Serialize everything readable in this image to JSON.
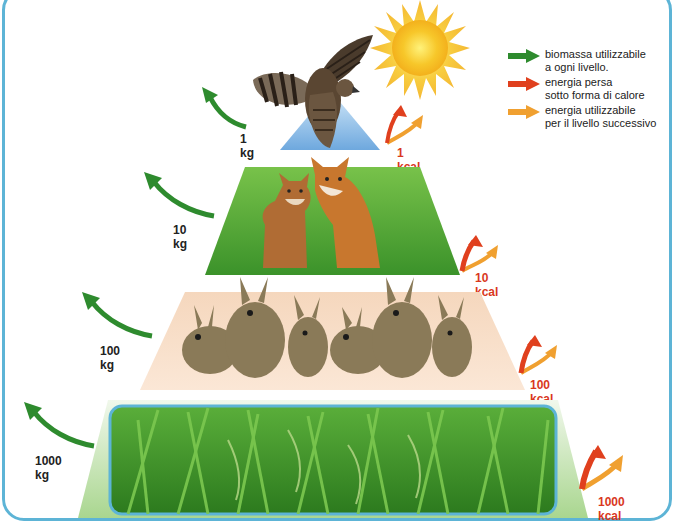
{
  "legend": {
    "items": [
      {
        "color": "#2e8b2e",
        "line1": "biomassa utilizzabile",
        "line2": "a ogni livello."
      },
      {
        "color": "#e0401e",
        "line1": "energia persa",
        "line2": "sotto forma di calore"
      },
      {
        "color": "#f0a030",
        "line1": "energia utilizzabile",
        "line2": "per il livello successivo"
      }
    ]
  },
  "levels": [
    {
      "name": "falco",
      "biomass": "1 kg",
      "energy": "1 kcal",
      "bg_color": "#7fb8e6"
    },
    {
      "name": "volpi",
      "biomass": "10 kg",
      "energy": "10 kcal",
      "bg_color": "#4a9e2a"
    },
    {
      "name": "conigli",
      "biomass": "100 kg",
      "energy": "100 kcal",
      "bg_color": "#f2cfb0"
    },
    {
      "name": "riso",
      "biomass": "1000 kg",
      "energy": "1000 kcal",
      "bg_color": "#3f9a2e"
    }
  ],
  "colors": {
    "frame": "#5db4d6",
    "biomass_arrow": "#2e8b2e",
    "heat_arrow": "#e0401e",
    "usable_arrow": "#f0a030",
    "sun": "#f7c72a"
  }
}
